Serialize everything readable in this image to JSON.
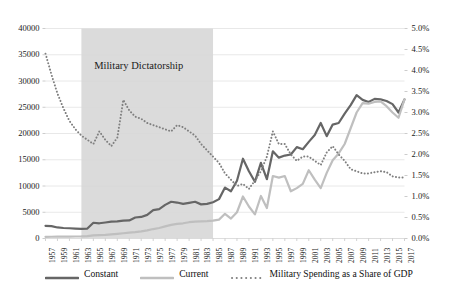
{
  "chart_data": {
    "type": "line",
    "title": "",
    "subtitle": "",
    "xlabel": "",
    "ylabel": "",
    "y2label": "",
    "grid": true,
    "legend_position": "bottom",
    "xlim": [
      1957,
      2017
    ],
    "ylim": [
      0,
      40000
    ],
    "y2lim": [
      0.0,
      5.0
    ],
    "y_ticks": [
      "0",
      "5000",
      "10000",
      "15000",
      "20000",
      "25000",
      "30000",
      "35000",
      "40000"
    ],
    "y_tick_values": [
      0,
      5000,
      10000,
      15000,
      20000,
      25000,
      30000,
      35000,
      40000
    ],
    "y2_ticks": [
      "0.0%",
      "0.5%",
      "1.0%",
      "1.5%",
      "2.0%",
      "2.5%",
      "3.0%",
      "3.5%",
      "4.0%",
      "4.5%",
      "5.0%"
    ],
    "y2_tick_values": [
      0.0,
      0.5,
      1.0,
      1.5,
      2.0,
      2.5,
      3.0,
      3.5,
      4.0,
      4.5,
      5.0
    ],
    "x_tick_labels": [
      "1957",
      "1959",
      "1961",
      "1963",
      "1965",
      "1967",
      "1969",
      "1971",
      "1973",
      "1975",
      "1977",
      "1979",
      "1981",
      "1983",
      "1985",
      "1987",
      "1989",
      "1991",
      "1993",
      "1995",
      "1997",
      "1999",
      "2001",
      "2003",
      "2005",
      "2007",
      "2009",
      "2011",
      "2013",
      "2015",
      "2017"
    ],
    "x": [
      1957,
      1958,
      1959,
      1960,
      1961,
      1962,
      1963,
      1964,
      1965,
      1966,
      1967,
      1968,
      1969,
      1970,
      1971,
      1972,
      1973,
      1974,
      1975,
      1976,
      1977,
      1978,
      1979,
      1980,
      1981,
      1982,
      1983,
      1984,
      1985,
      1986,
      1987,
      1988,
      1989,
      1990,
      1991,
      1992,
      1993,
      1994,
      1995,
      1996,
      1997,
      1998,
      1999,
      2000,
      2001,
      2002,
      2003,
      2004,
      2005,
      2006,
      2007,
      2008,
      2009,
      2010,
      2011,
      2012,
      2013,
      2014,
      2015,
      2016,
      2017
    ],
    "annotations": [
      {
        "text": "Military Dictatorship",
        "type": "shaded-band-label",
        "x_start": 1963,
        "x_end": 1985
      }
    ],
    "shaded_band": {
      "label": "Military Dictatorship",
      "x_start": 1963,
      "x_end": 1985,
      "color": "#d9d9d9"
    },
    "series": [
      {
        "name": "Constant",
        "axis": "left",
        "style": "solid",
        "color": "#666666",
        "width": 2.2,
        "values": [
          2400,
          2350,
          2100,
          2000,
          1950,
          1900,
          1850,
          1900,
          3000,
          2900,
          3050,
          3200,
          3250,
          3400,
          3450,
          4000,
          4100,
          4500,
          5400,
          5600,
          6400,
          7000,
          6850,
          6600,
          6800,
          7000,
          6500,
          6600,
          6900,
          7500,
          9700,
          9000,
          11000,
          15200,
          12800,
          10800,
          14400,
          11300,
          16600,
          15400,
          15800,
          16000,
          17400,
          17000,
          18400,
          19700,
          22000,
          19500,
          21700,
          22000,
          23800,
          25400,
          27300,
          26400,
          26000,
          26600,
          26500,
          26200,
          25600,
          24000,
          26500
        ]
      },
      {
        "name": "Current",
        "axis": "left",
        "style": "solid",
        "color": "#bfbfbf",
        "width": 2.2,
        "values": [
          320,
          330,
          340,
          350,
          360,
          380,
          400,
          450,
          600,
          650,
          700,
          800,
          900,
          1000,
          1100,
          1200,
          1350,
          1550,
          1800,
          2000,
          2300,
          2600,
          2800,
          2900,
          3100,
          3200,
          3250,
          3300,
          3400,
          3600,
          4700,
          3800,
          5000,
          8000,
          6100,
          4600,
          8100,
          5800,
          11900,
          11600,
          11900,
          9000,
          9600,
          10400,
          13000,
          11200,
          9600,
          12500,
          14900,
          16200,
          18000,
          21000,
          24000,
          25800,
          25700,
          26000,
          26100,
          25200,
          24000,
          23000,
          26500
        ]
      },
      {
        "name": "Military Spending as a Share of GDP",
        "axis": "right",
        "style": "dotted",
        "color": "#808080",
        "width": 1.8,
        "values": [
          4.4,
          3.9,
          3.45,
          3.1,
          2.8,
          2.6,
          2.45,
          2.35,
          2.25,
          2.55,
          2.35,
          2.2,
          2.4,
          3.3,
          3.05,
          2.9,
          2.85,
          2.75,
          2.7,
          2.65,
          2.6,
          2.55,
          2.7,
          2.65,
          2.55,
          2.45,
          2.25,
          2.1,
          1.95,
          1.8,
          1.55,
          1.4,
          1.25,
          1.3,
          1.18,
          1.38,
          1.6,
          1.95,
          2.55,
          2.25,
          2.25,
          2.0,
          1.85,
          1.95,
          1.95,
          1.85,
          1.75,
          2.05,
          2.2,
          2.0,
          1.85,
          1.65,
          1.6,
          1.55,
          1.55,
          1.58,
          1.6,
          1.58,
          1.48,
          1.45,
          1.45
        ]
      }
    ]
  },
  "legend": {
    "items": [
      {
        "label": "Constant",
        "color": "#666666",
        "style": "solid"
      },
      {
        "label": "Current",
        "color": "#bfbfbf",
        "style": "solid"
      },
      {
        "label": "Military Spending as a Share of GDP",
        "color": "#808080",
        "style": "dotted"
      }
    ]
  },
  "colors": {
    "constant": "#666666",
    "current": "#bfbfbf",
    "gdp_share": "#808080",
    "band": "#d9d9d9",
    "grid": "#d9d9d9"
  }
}
